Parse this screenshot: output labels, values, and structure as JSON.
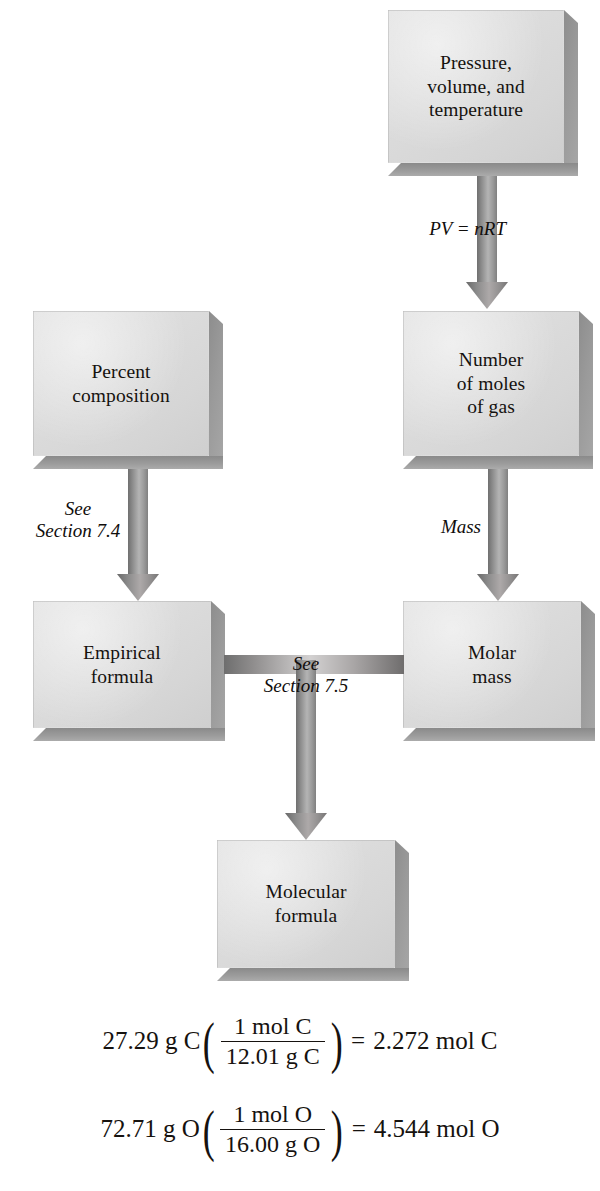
{
  "diagram": {
    "type": "flowchart",
    "nodes": [
      {
        "id": "pvt",
        "label": "Pressure,\nvolume, and\ntemperature"
      },
      {
        "id": "percent",
        "label": "Percent\ncomposition"
      },
      {
        "id": "moles",
        "label": "Number\nof moles\nof gas"
      },
      {
        "id": "empirical",
        "label": "Empirical\nformula"
      },
      {
        "id": "molar",
        "label": "Molar\nmass"
      },
      {
        "id": "molecular",
        "label": "Molecular\nformula"
      }
    ],
    "edges": [
      {
        "id": "e1",
        "from": "pvt",
        "to": "moles",
        "label": "PV = nRT",
        "direction": "down"
      },
      {
        "id": "e2",
        "from": "percent",
        "to": "empirical",
        "label": "See\nSection 7.4",
        "direction": "down"
      },
      {
        "id": "e3",
        "from": "moles",
        "to": "molar",
        "label": "Mass",
        "direction": "down"
      },
      {
        "id": "e4",
        "from": "empirical",
        "to": "molecular",
        "label": "See\nSection 7.5",
        "direction": "down-join",
        "joins": "molar"
      }
    ],
    "colors": {
      "box_face": "#d9d9d9",
      "box_shadow": "#969696",
      "arrow": "#8b8b8b",
      "text": "#15120f",
      "background": "#ffffff"
    }
  },
  "edge_labels": {
    "pv_nrt": "PV = nRT",
    "see": "See",
    "section_74": "Section 7.4",
    "section_75": "Section 7.5",
    "mass": "Mass"
  },
  "node_labels": {
    "pvt_l1": "Pressure,",
    "pvt_l2": "volume, and",
    "pvt_l3": "temperature",
    "percent_l1": "Percent",
    "percent_l2": "composition",
    "moles_l1": "Number",
    "moles_l2": "of moles",
    "moles_l3": "of gas",
    "empirical_l1": "Empirical",
    "empirical_l2": "formula",
    "molar_l1": "Molar",
    "molar_l2": "mass",
    "molecular_l1": "Molecular",
    "molecular_l2": "formula"
  },
  "equations": [
    {
      "id": "carbon",
      "lead": "27.29 g C",
      "numerator": "1 mol C",
      "denominator": "12.01 g C",
      "equals": "=",
      "result": "2.272 mol C",
      "full_text": "27.29 g C(1 mol C / 12.01 g C) = 2.272 mol C"
    },
    {
      "id": "oxygen",
      "lead": "72.71 g O",
      "numerator": "1 mol O",
      "denominator": "16.00 g O",
      "equals": "=",
      "result": "4.544 mol O",
      "full_text": "72.71 g O(1 mol O / 16.00 g O) = 4.544 mol O"
    }
  ],
  "parens": {
    "open": "(",
    "close": ")"
  }
}
